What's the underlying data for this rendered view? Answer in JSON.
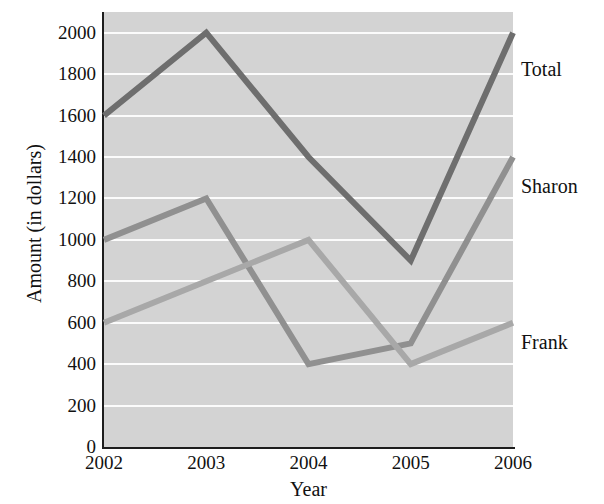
{
  "chart_data": {
    "type": "line",
    "title": "",
    "xlabel": "Year",
    "ylabel": "Amount (in dollars)",
    "categories": [
      "2002",
      "2003",
      "2004",
      "2005",
      "2006"
    ],
    "x": [
      2002,
      2003,
      2004,
      2005,
      2006
    ],
    "ylim": [
      0,
      2100
    ],
    "yticks": [
      0,
      200,
      400,
      600,
      800,
      1000,
      1200,
      1400,
      1600,
      1800,
      2000
    ],
    "ytick_labels": [
      "0",
      "200",
      "400",
      "600",
      "800",
      "1000",
      "1200",
      "1400",
      "1600",
      "1800",
      "2000"
    ],
    "grid": true,
    "grid_color": "#fbfbfb",
    "plot_background": "#d3d3d3",
    "legend_position": "right-inline-labels",
    "series": [
      {
        "name": "Total",
        "values": [
          1600,
          2000,
          1400,
          900,
          2000
        ],
        "color": "#6e6e6e",
        "label_y": 58
      },
      {
        "name": "Sharon",
        "values": [
          1000,
          1200,
          400,
          500,
          1400
        ],
        "color": "#909090",
        "label_y": 175
      },
      {
        "name": "Frank",
        "values": [
          600,
          800,
          1000,
          400,
          600
        ],
        "color": "#a8a8a8",
        "label_y": 331
      }
    ]
  },
  "clipped_header": "",
  "axis": {
    "x_title": "Year",
    "y_title": "Amount (in dollars)"
  }
}
